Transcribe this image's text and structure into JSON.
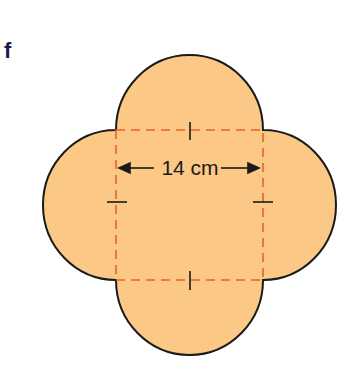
{
  "question_label": "f",
  "dimension_label": "14 cm",
  "colors": {
    "fill": "#fbc886",
    "outline": "#1a1a1a",
    "dashed": "#e8622c",
    "label": "#1c1a4f"
  },
  "shape": {
    "description": "square of side 14 cm with a semicircle on each side",
    "side": "14 cm"
  }
}
